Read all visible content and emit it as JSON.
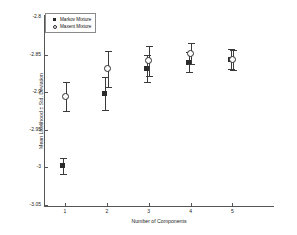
{
  "chart_data": {
    "type": "scatter",
    "title": "",
    "xlabel": "Number of Components",
    "ylabel": "Mean Likelihood ± Std. Deviation",
    "x": [
      1,
      2,
      3,
      4,
      5
    ],
    "xticklabels": [
      "1",
      "2",
      "3",
      "4",
      "5"
    ],
    "yticklabels": [
      "-2.8",
      "-2.85",
      "-2.9",
      "-2.95",
      "-3",
      "-3.05"
    ],
    "yticks": [
      -2.8,
      -2.85,
      -2.9,
      -2.95,
      -3.0,
      -3.05
    ],
    "xlim": [
      0.5,
      5.8
    ],
    "ylim": [
      -3.05,
      -2.8
    ],
    "grid": false,
    "legend_position": "upper left",
    "marker_color": "#2b2b2b",
    "errorbar_color": "#3a3a3a",
    "series": [
      {
        "name": "Markov Mixture",
        "marker": "square",
        "values": [
          -2.998,
          -2.902,
          -2.869,
          -2.86,
          -2.856
        ],
        "errors": [
          0.011,
          0.022,
          0.018,
          0.013,
          0.013
        ]
      },
      {
        "name": "Maxent Mixture",
        "marker": "circle",
        "values": [
          -2.906,
          -2.869,
          -2.858,
          -2.849,
          -2.857
        ],
        "errors": [
          0.019,
          0.024,
          0.02,
          0.014,
          0.013
        ]
      }
    ]
  },
  "legend": {
    "items": [
      {
        "label": "Markov Mixture",
        "key": "square-marker-icon"
      },
      {
        "label": "Maxent Mixture",
        "key": "circle-marker-icon"
      }
    ]
  }
}
